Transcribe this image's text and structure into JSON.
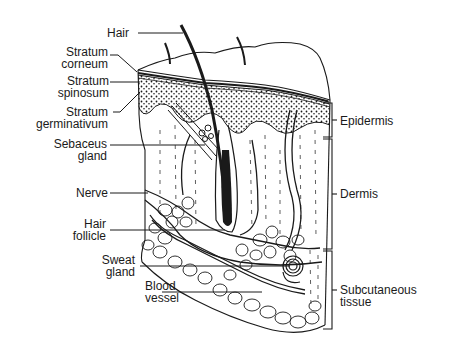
{
  "diagram": {
    "left_labels": [
      {
        "id": "hair",
        "lines": [
          "Hair"
        ]
      },
      {
        "id": "stratum-corneum",
        "lines": [
          "Stratum",
          "corneum"
        ]
      },
      {
        "id": "stratum-spinosum",
        "lines": [
          "Stratum",
          "spinosum"
        ]
      },
      {
        "id": "stratum-germinativum",
        "lines": [
          "Stratum",
          "germinativum"
        ]
      },
      {
        "id": "sebaceus-gland",
        "lines": [
          "Sebaceus",
          "gland"
        ]
      },
      {
        "id": "nerve",
        "lines": [
          "Nerve"
        ]
      },
      {
        "id": "hair-follicle",
        "lines": [
          "Hair",
          "follicle"
        ]
      },
      {
        "id": "sweat-gland",
        "lines": [
          "Sweat",
          "gland"
        ]
      },
      {
        "id": "blood-vessel",
        "lines": [
          "Blood",
          "vessel"
        ]
      }
    ],
    "right_labels": [
      {
        "id": "epidermis",
        "lines": [
          "Epidermis"
        ]
      },
      {
        "id": "dermis",
        "lines": [
          "Dermis"
        ]
      },
      {
        "id": "subcutaneous-tissue",
        "lines": [
          "Subcutaneous",
          "tissue"
        ]
      }
    ],
    "colors": {
      "ink": "#1a1a1a",
      "background": "#ffffff"
    }
  }
}
